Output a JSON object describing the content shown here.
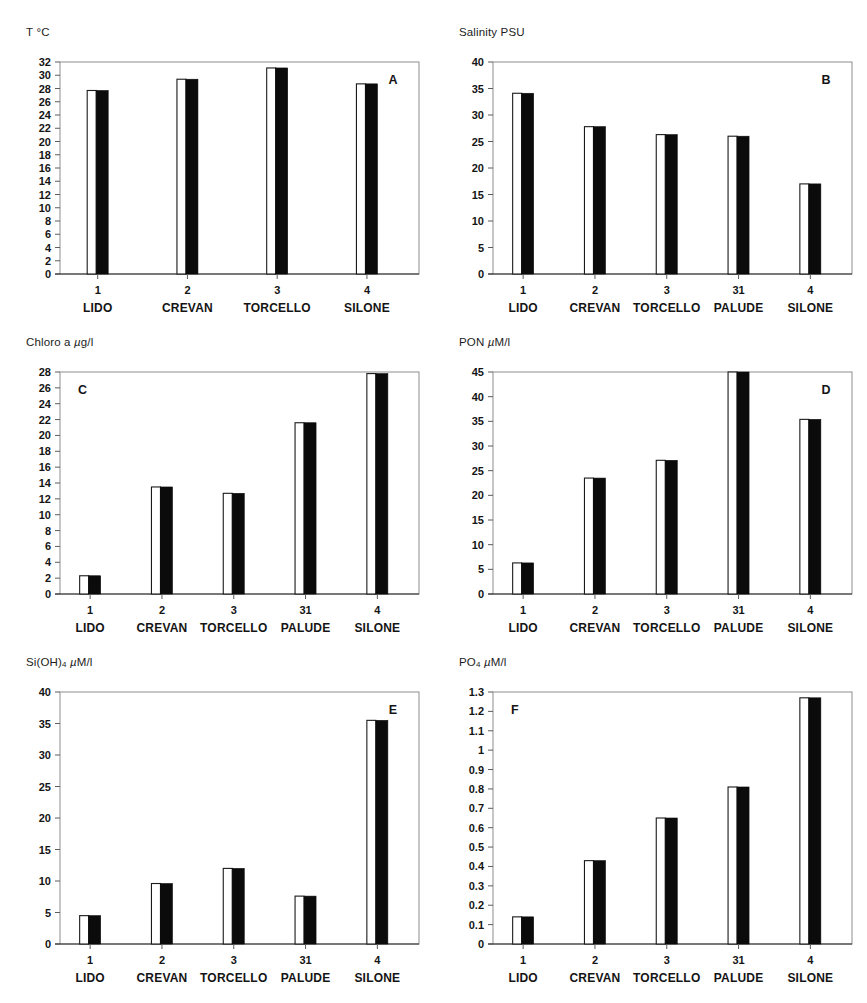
{
  "figure": {
    "name": "six-panel-bar-figure",
    "background": "#ffffff",
    "bar_white_color": "#ffffff",
    "bar_black_color": "#0b0b0b",
    "frame_color": "#8d8d8d"
  },
  "chart_data": [
    {
      "type": "bar",
      "panel_letter": "A",
      "panel_letter_position": "top-right",
      "title": "T °C",
      "ylabel": "T °C",
      "xlabel": "",
      "ylim": [
        0,
        32
      ],
      "yticks": [
        0,
        2,
        4,
        6,
        8,
        10,
        12,
        14,
        16,
        18,
        20,
        22,
        24,
        26,
        28,
        30,
        32
      ],
      "ytick_labels": [
        "0",
        "2",
        "4",
        "6",
        "8",
        "10",
        "12",
        "14",
        "16",
        "18",
        "20",
        "22",
        "24",
        "26",
        "28",
        "30",
        "32"
      ],
      "grid": false,
      "legend": "none",
      "categories": [
        "LIDO",
        "CREVAN",
        "TORCELLO",
        "SILONE"
      ],
      "category_numbers": [
        "1",
        "2",
        "3",
        "4"
      ],
      "values": [
        27.7,
        29.4,
        31.1,
        28.7
      ]
    },
    {
      "type": "bar",
      "panel_letter": "B",
      "panel_letter_position": "top-right",
      "title": "Salinity PSU",
      "ylabel": "Salinity PSU",
      "xlabel": "",
      "ylim": [
        0,
        40
      ],
      "yticks": [
        0,
        5,
        10,
        15,
        20,
        25,
        30,
        35,
        40
      ],
      "ytick_labels": [
        "0",
        "5",
        "10",
        "15",
        "20",
        "25",
        "30",
        "35",
        "40"
      ],
      "grid": false,
      "legend": "none",
      "categories": [
        "LIDO",
        "CREVAN",
        "TORCELLO",
        "PALUDE",
        "SILONE"
      ],
      "category_numbers": [
        "1",
        "2",
        "3",
        "31",
        "4"
      ],
      "values": [
        34.1,
        27.8,
        26.3,
        26.0,
        17.0
      ]
    },
    {
      "type": "bar",
      "panel_letter": "C",
      "panel_letter_position": "top-left",
      "title": "Chloro a µg/l",
      "ylabel": "Chloro a µg/l",
      "xlabel": "",
      "ylim": [
        0,
        28
      ],
      "yticks": [
        0,
        2,
        4,
        6,
        8,
        10,
        12,
        14,
        16,
        18,
        20,
        22,
        24,
        26,
        28
      ],
      "ytick_labels": [
        "0",
        "2",
        "4",
        "6",
        "8",
        "10",
        "12",
        "14",
        "16",
        "18",
        "20",
        "22",
        "24",
        "26",
        "28"
      ],
      "grid": false,
      "legend": "none",
      "categories": [
        "LIDO",
        "CREVAN",
        "TORCELLO",
        "PALUDE",
        "SILONE"
      ],
      "category_numbers": [
        "1",
        "2",
        "3",
        "31",
        "4"
      ],
      "values": [
        2.3,
        13.5,
        12.7,
        21.6,
        27.8
      ]
    },
    {
      "type": "bar",
      "panel_letter": "D",
      "panel_letter_position": "top-right",
      "title": "PON µM/l",
      "ylabel": "PON µM/l",
      "xlabel": "",
      "ylim": [
        0,
        45
      ],
      "yticks": [
        0,
        5,
        10,
        15,
        20,
        25,
        30,
        35,
        40,
        45
      ],
      "ytick_labels": [
        "0",
        "5",
        "10",
        "15",
        "20",
        "25",
        "30",
        "35",
        "40",
        "45"
      ],
      "grid": false,
      "legend": "none",
      "categories": [
        "LIDO",
        "CREVAN",
        "TORCELLO",
        "PALUDE",
        "SILONE"
      ],
      "category_numbers": [
        "1",
        "2",
        "3",
        "31",
        "4"
      ],
      "values": [
        6.3,
        23.5,
        27.1,
        45.0,
        35.4
      ]
    },
    {
      "type": "bar",
      "panel_letter": "E",
      "panel_letter_position": "top-right",
      "title": "Si(OH)4 µM/l",
      "ylabel": "Si(OH)4 µM/l",
      "xlabel": "",
      "ylim": [
        0,
        40
      ],
      "yticks": [
        0,
        5,
        10,
        15,
        20,
        25,
        30,
        35,
        40
      ],
      "ytick_labels": [
        "0",
        "5",
        "10",
        "15",
        "20",
        "25",
        "30",
        "35",
        "40"
      ],
      "grid": false,
      "legend": "none",
      "categories": [
        "LIDO",
        "CREVAN",
        "TORCELLO",
        "PALUDE",
        "SILONE"
      ],
      "category_numbers": [
        "1",
        "2",
        "3",
        "31",
        "4"
      ],
      "values": [
        4.5,
        9.6,
        12.0,
        7.6,
        35.5
      ]
    },
    {
      "type": "bar",
      "panel_letter": "F",
      "panel_letter_position": "top-left",
      "title": "PO4 µM/l",
      "ylabel": "PO4 µM/l",
      "xlabel": "",
      "ylim": [
        0,
        1.3
      ],
      "yticks": [
        0,
        0.1,
        0.2,
        0.3,
        0.4,
        0.5,
        0.6,
        0.7,
        0.8,
        0.9,
        1.0,
        1.1,
        1.2,
        1.3
      ],
      "ytick_labels": [
        "0",
        "0.1",
        "0.2",
        "0.3",
        "0.4",
        "0.5",
        "0.6",
        "0.7",
        "0.8",
        "0.9",
        "1",
        "1.1",
        "1.2",
        "1.3"
      ],
      "grid": false,
      "legend": "none",
      "categories": [
        "LIDO",
        "CREVAN",
        "TORCELLO",
        "PALUDE",
        "SILONE"
      ],
      "category_numbers": [
        "1",
        "2",
        "3",
        "31",
        "4"
      ],
      "values": [
        0.14,
        0.43,
        0.65,
        0.81,
        1.27
      ]
    }
  ]
}
